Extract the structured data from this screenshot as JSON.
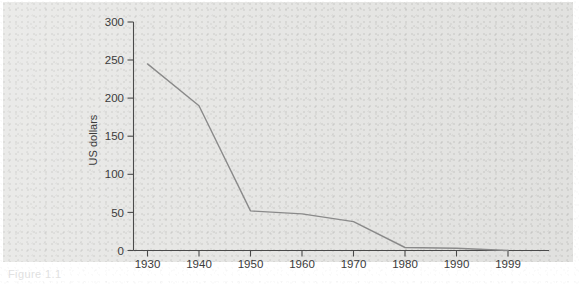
{
  "figure": {
    "caption": "Figure 1.1",
    "background_color": "#e6e6e4",
    "line_color": "#8a8a8a",
    "axis_color": "#4a4a4a",
    "text_color": "#3b3b3b"
  },
  "chart_data": {
    "type": "line",
    "title": "",
    "xlabel": "",
    "ylabel": "US dollars",
    "x": [
      1930,
      1940,
      1950,
      1960,
      1970,
      1980,
      1990,
      1999
    ],
    "categories": [
      "1930",
      "1940",
      "1950",
      "1960",
      "1970",
      "1980",
      "1990",
      "1999"
    ],
    "values": [
      245,
      190,
      52,
      48,
      38,
      4,
      3,
      0
    ],
    "series": [
      {
        "name": "US dollars",
        "values": [
          245,
          190,
          52,
          48,
          38,
          4,
          3,
          0
        ]
      }
    ],
    "xlim": [
      1925,
      2004
    ],
    "ylim": [
      0,
      300
    ],
    "yticks": [
      0,
      50,
      100,
      150,
      200,
      250,
      300
    ],
    "ytick_labels": [
      "0",
      "50",
      "100",
      "150",
      "200",
      "250",
      "300"
    ],
    "xtick_labels": [
      "1930",
      "1940",
      "1950",
      "1960",
      "1970",
      "1980",
      "1990",
      "1999"
    ],
    "grid": false,
    "legend": false,
    "legend_position": "none"
  }
}
